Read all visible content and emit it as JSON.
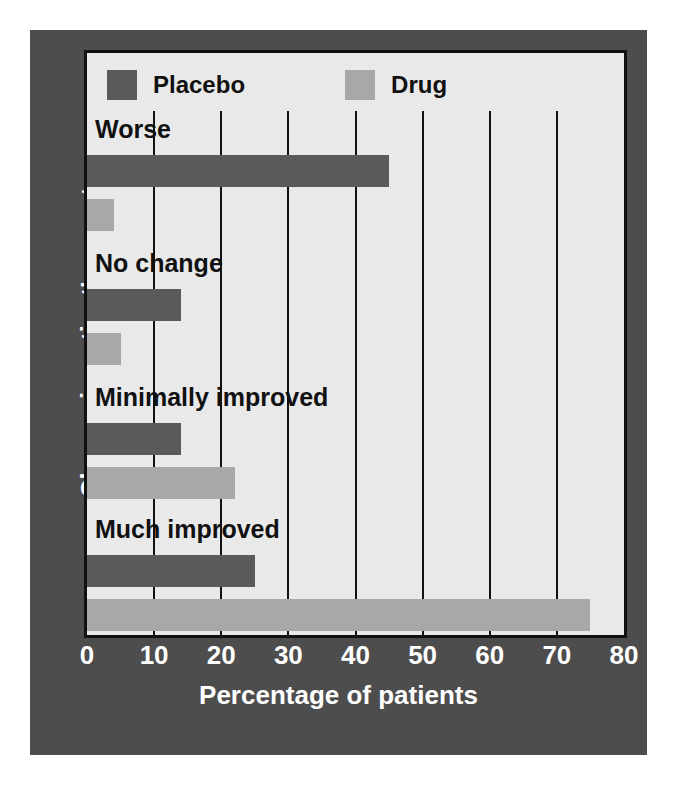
{
  "chart_data": {
    "type": "bar",
    "orientation": "horizontal",
    "title": "",
    "xlabel": "Percentage of patients",
    "ylabel": "Change in patient's symptoms",
    "categories": [
      "Worse",
      "No change",
      "Minimally improved",
      "Much improved"
    ],
    "series": [
      {
        "name": "Placebo",
        "color": "#5a5a5a",
        "values": [
          45,
          14,
          14,
          25
        ]
      },
      {
        "name": "Drug",
        "color": "#a8a8a8",
        "values": [
          4,
          5,
          22,
          75
        ]
      }
    ],
    "xlim": [
      0,
      80
    ],
    "xticks": [
      0,
      10,
      20,
      30,
      40,
      50,
      60,
      70,
      80
    ],
    "xtick_labels": [
      "0",
      "10",
      "20",
      "30",
      "40",
      "50",
      "60",
      "70",
      "80"
    ],
    "grid": "vertical-only",
    "legend_position": "top-left-inside",
    "plot_background": "#e9e9e9",
    "panel_background": "#4d4d4d",
    "axis_color": "#111111",
    "tick_label_color": "#ffffff"
  },
  "legend": {
    "items": [
      {
        "label": "Placebo",
        "color": "#5a5a5a"
      },
      {
        "label": "Drug",
        "color": "#a8a8a8"
      }
    ]
  }
}
